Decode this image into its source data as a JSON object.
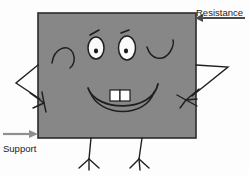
{
  "diagram": {
    "body": {
      "shape_name": "gray-rectangle-body",
      "fill_color": "#878787",
      "stroke_color": "#2b2b2b",
      "x": 38,
      "y": 13,
      "width": 158,
      "height": 125
    },
    "face": {
      "expression": "smiling",
      "left_eye": "white-oval-with-dark-pupil",
      "right_eye": "white-oval-with-dark-pupil",
      "left_eyebrow": "short-angled-stroke",
      "right_eyebrow": "short-angled-stroke",
      "mouth": "wide-open-smile",
      "teeth_count": 2,
      "teeth_color": "#ffffff",
      "left_cheek": "curved-line",
      "right_cheek": "curved-line"
    },
    "limbs": {
      "left_arm": "bent-stick-arm-with-hand",
      "right_arm": "bent-stick-arm-with-hand",
      "left_leg": "stick-leg-with-three-toed-foot",
      "right_leg": "stick-leg-with-three-toed-foot",
      "leg_count": 2,
      "arm_count": 2
    },
    "annotations": [
      {
        "id": "resistance",
        "label": "Resistance",
        "direction": "left",
        "arrow_color": "#4a4a4a",
        "label_x": 196,
        "label_y": 9,
        "arrow_tip_x": 196,
        "arrow_tail_x": 245,
        "arrow_y": 18
      },
      {
        "id": "support",
        "label": "Support",
        "direction": "right",
        "arrow_color": "#8f8f8f",
        "label_x": 3,
        "label_y": 152,
        "arrow_tip_x": 37,
        "arrow_tail_x": 3,
        "arrow_y": 134
      }
    ]
  }
}
